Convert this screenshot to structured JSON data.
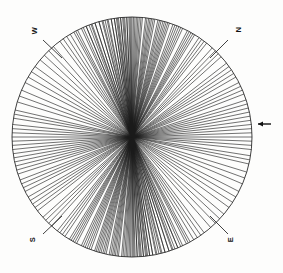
{
  "figure": {
    "type": "rose-ray-diagram",
    "background_color": "#fdfdfc",
    "line_color": "#1a1a1a",
    "circle_stroke": "#2b2b2b"
  },
  "compass": {
    "north_label": "N",
    "east_label": "E",
    "south_label": "S",
    "west_label": "W"
  },
  "tick": {
    "right_tick_name": "right-edge-tick"
  },
  "chart_data": {
    "type": "line",
    "title": "",
    "subtitle": "",
    "xlabel": "",
    "ylabel": "",
    "legend": [],
    "grid": false,
    "plot_kind": "rose-diagram-rays",
    "center_px": [
      132,
      137
    ],
    "radius_px": 120,
    "angle_units": "degrees",
    "angle_convention": "azimuth clockwise from North (up)",
    "axis_labels": [
      "N",
      "E",
      "S",
      "W"
    ],
    "axis_label_angles": [
      0,
      90,
      180,
      270
    ],
    "axis_label_rotation_deg": -90,
    "ray_count": 118,
    "ray_render_mode": "full-diameter",
    "azimuths": [
      0,
      0.7,
      1.4,
      2.1,
      2.8,
      3.5,
      4.3,
      5.0,
      6.5,
      7.2,
      8.0,
      8.7,
      9.4,
      10.2,
      11.0,
      12.5,
      13.3,
      14.1,
      15.0,
      15.8,
      16.6,
      17.4,
      18.2,
      20.0,
      21.0,
      22.0,
      23.0,
      24.0,
      25.0,
      27.5,
      28.5,
      29.5,
      30.5,
      31.5,
      34.0,
      35.5,
      37.0,
      38.5,
      42.0,
      44.0,
      46.0,
      48.0,
      52.0,
      54.0,
      56.0,
      58.0,
      60.0,
      63.0,
      65.0,
      67.0,
      69.0,
      72.0,
      74.0,
      76.0,
      78.0,
      80.0,
      82.0,
      84.0,
      86.0,
      88.0,
      90.0,
      92.0,
      94.0,
      96.0,
      99.0,
      101.0,
      103.0,
      107.0,
      110.0,
      113.0,
      117.0,
      120.0,
      123.0,
      126.0,
      130.0,
      133.0,
      136.0,
      139.0,
      143.0,
      145.0,
      147.0,
      149.0,
      151.0,
      153.0,
      156.0,
      157.5,
      159.0,
      160.5,
      162.0,
      164.0,
      165.5,
      167.0,
      168.5,
      170.0,
      171.5,
      172.5,
      173.5,
      174.5,
      175.5,
      176.5,
      177.5,
      178.5,
      179.5,
      350.0,
      351.5,
      353.0,
      354.5,
      356.0,
      357.5,
      359.0,
      340.0,
      342.0,
      344.0,
      346.0,
      348.0,
      332.0,
      335.0,
      337.5
    ],
    "cluster_summary": [
      {
        "name": "N-S near-vertical cluster",
        "azimuth_range": [
          350,
          18
        ],
        "density": "very high"
      },
      {
        "name": "NNE cluster",
        "azimuth_range": [
          18,
          40
        ],
        "density": "high"
      },
      {
        "name": "NE-ENE spread",
        "azimuth_range": [
          40,
          80
        ],
        "density": "moderate"
      },
      {
        "name": "E-W near-horizontal cluster",
        "azimuth_range": [
          80,
          100
        ],
        "density": "high"
      },
      {
        "name": "ESE-SE spread",
        "azimuth_range": [
          100,
          140
        ],
        "density": "moderate"
      },
      {
        "name": "SSE-S cluster",
        "azimuth_range": [
          140,
          180
        ],
        "density": "very high"
      },
      {
        "name": "NNW cluster",
        "azimuth_range": [
          330,
          350
        ],
        "density": "moderate"
      }
    ]
  }
}
